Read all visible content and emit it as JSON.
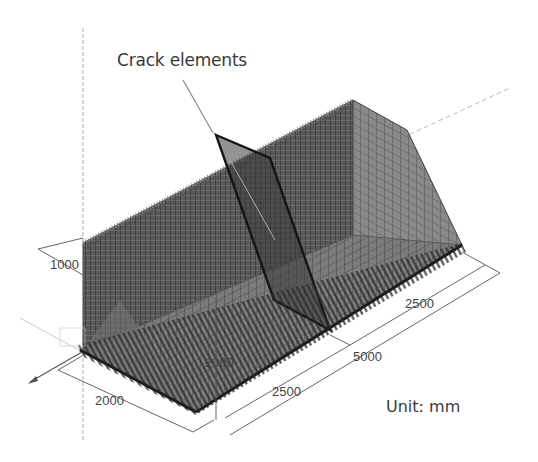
{
  "figure": {
    "callout": "Crack elements",
    "unit_label": "Unit: mm",
    "dimensions": {
      "wall_thickness": "1000",
      "base_width": "2000",
      "wall_height": "2000",
      "half_length_front": "2500",
      "half_length_back": "2500",
      "total_length": "5000"
    },
    "colors": {
      "mesh_dark": "#4a4a4a",
      "mesh_mid": "#6e6e6e",
      "mesh_light": "#8c8c8c",
      "crack_outline": "#1a1a1a",
      "dimension_line": "#555555",
      "background": "#ffffff"
    }
  }
}
